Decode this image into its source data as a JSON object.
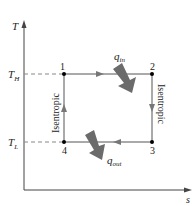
{
  "diagram": {
    "type": "T-s diagram (Carnot cycle)",
    "axes": {
      "y_label": "T",
      "x_label": "s"
    },
    "temperature_levels": {
      "high": {
        "symbol": "T",
        "subscript": "H"
      },
      "low": {
        "symbol": "T",
        "subscript": "L"
      }
    },
    "states": [
      {
        "id": "1",
        "label": "1"
      },
      {
        "id": "2",
        "label": "2"
      },
      {
        "id": "3",
        "label": "3"
      },
      {
        "id": "4",
        "label": "4"
      }
    ],
    "processes": [
      {
        "from": "1",
        "to": "2",
        "type": "isothermal heat addition"
      },
      {
        "from": "2",
        "to": "3",
        "type": "isentropic",
        "label": "Isentropic"
      },
      {
        "from": "3",
        "to": "4",
        "type": "isothermal heat rejection"
      },
      {
        "from": "4",
        "to": "1",
        "type": "isentropic",
        "label": "Isentropic"
      }
    ],
    "heat_in": {
      "symbol": "q",
      "subscript": "in"
    },
    "heat_out": {
      "symbol": "q",
      "subscript": "out"
    },
    "colors": {
      "line": "#555555",
      "heat_arrow": "#6b6b6b",
      "dashed": "#888888",
      "point": "#000000"
    }
  }
}
